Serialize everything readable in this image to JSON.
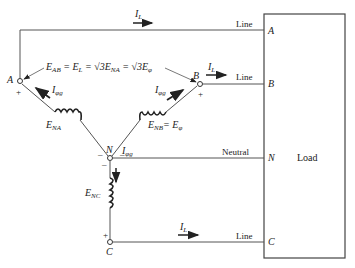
{
  "diagram": {
    "terminals": {
      "a": "A",
      "b": "B",
      "c": "C",
      "n": "N"
    },
    "polarity": {
      "plus": "+",
      "minus": "–"
    },
    "line_labels": {
      "a": "Line",
      "b": "Line",
      "neutral": "Neutral",
      "c": "Line"
    },
    "load": {
      "label": "Load",
      "terminals": [
        "A",
        "B",
        "N",
        "C"
      ]
    },
    "currents": {
      "line": {
        "main": "I",
        "sub": "L"
      },
      "phase": {
        "main": "I",
        "sub": "φg"
      }
    },
    "voltages": {
      "ena": {
        "main": "E",
        "sub": "NA"
      },
      "enb": {
        "main": "E",
        "sub": "NB"
      },
      "enc": {
        "main": "E",
        "sub": "NC"
      },
      "enb_equals": "= E",
      "enb_equals_sub": "φ"
    },
    "equation": {
      "p1": "E",
      "p1_sub": "AB",
      "p2": " = E",
      "p2_sub": "L",
      "p3": " = √3E",
      "p3_sub": "NA",
      "p4": " = √3E",
      "p4_sub": "φ"
    },
    "colors": {
      "line": "#555555",
      "text": "#222222"
    }
  }
}
